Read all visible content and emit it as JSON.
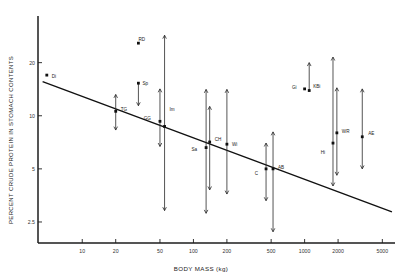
{
  "chart_data": {
    "type": "scatter",
    "title": "",
    "xlabel": "BODY MASS (kg)",
    "ylabel": "PERCENT CRUDE PROTEIN IN STOMACH CONTENTS",
    "xscale": "log",
    "yscale": "log",
    "xlim": [
      4,
      6500
    ],
    "ylim": [
      1.9,
      34
    ],
    "xticks": [
      10,
      20,
      50,
      100,
      200,
      500,
      1000,
      2000,
      5000
    ],
    "xticklabels": [
      "10",
      "20",
      "50",
      "100",
      "200",
      "500",
      "1000",
      "2000",
      "5000"
    ],
    "yticks": [
      2.5,
      5,
      10,
      20
    ],
    "yticklabels": [
      "2.5",
      "5",
      "10",
      "20"
    ],
    "grid": false,
    "legend": null,
    "regression": {
      "label": "",
      "x_start": 4.4,
      "y_start": 15.6,
      "x_end": 6100,
      "y_end": 2.85
    },
    "points": [
      {
        "label": "Di",
        "x": 4.8,
        "y": 17.0,
        "low": 17.0,
        "high": 17.0,
        "label_dx": 5,
        "label_dy": 1
      },
      {
        "label": "RD",
        "x": 32,
        "y": 25.8,
        "low": 25.8,
        "high": 25.8,
        "label_dx": 0,
        "label_dy": -4
      },
      {
        "label": "TG",
        "x": 20,
        "y": 10.6,
        "low": 8.3,
        "high": 13.2,
        "label_dx": 5,
        "label_dy": -2
      },
      {
        "label": "Sp",
        "x": 32,
        "y": 15.3,
        "low": 11.4,
        "high": 15.3,
        "label_dx": 4,
        "label_dy": 0
      },
      {
        "label": "GG",
        "x": 50,
        "y": 9.3,
        "low": 6.7,
        "high": 14.2,
        "label_dx": -9,
        "label_dy": -3
      },
      {
        "label": "Im",
        "x": 55,
        "y": 8.7,
        "low": 2.9,
        "high": 28.6,
        "label_dx": 5,
        "label_dy": -17
      },
      {
        "label": "Sa",
        "x": 130,
        "y": 6.6,
        "low": 2.8,
        "high": 14.1,
        "label_dx": -9,
        "label_dy": 2
      },
      {
        "label": "CH",
        "x": 140,
        "y": 7.1,
        "low": 3.8,
        "high": 11.3,
        "label_dx": 5,
        "label_dy": -3
      },
      {
        "label": "Wi",
        "x": 200,
        "y": 6.9,
        "low": 3.6,
        "high": 14.1,
        "label_dx": 5,
        "label_dy": 0
      },
      {
        "label": "C",
        "x": 450,
        "y": 5.0,
        "low": 3.3,
        "high": 7.0,
        "label_dx": -8,
        "label_dy": 5
      },
      {
        "label": "AB",
        "x": 520,
        "y": 5.0,
        "low": 2.2,
        "high": 8.1,
        "label_dx": 5,
        "label_dy": -1
      },
      {
        "label": "Gi",
        "x": 1000,
        "y": 14.2,
        "low": 14.2,
        "high": 14.2,
        "label_dx": -8,
        "label_dy": -1
      },
      {
        "label": "KBi",
        "x": 1100,
        "y": 13.9,
        "low": 13.9,
        "high": 20.0,
        "label_dx": 4,
        "label_dy": -4
      },
      {
        "label": "Hi",
        "x": 1800,
        "y": 7.0,
        "low": 4.0,
        "high": 21.5,
        "label_dx": -8,
        "label_dy": 9
      },
      {
        "label": "WR",
        "x": 1950,
        "y": 8.0,
        "low": 4.6,
        "high": 14.4,
        "label_dx": 5,
        "label_dy": -1
      },
      {
        "label": "AE",
        "x": 3300,
        "y": 7.6,
        "low": 5.0,
        "high": 14.2,
        "label_dx": 6,
        "label_dy": -3
      }
    ]
  },
  "colors": {
    "axis": "#1d1d1d",
    "marker": "#101010",
    "errorbar": "#2a2a2a",
    "regression": "#111111",
    "text": "#222222"
  }
}
